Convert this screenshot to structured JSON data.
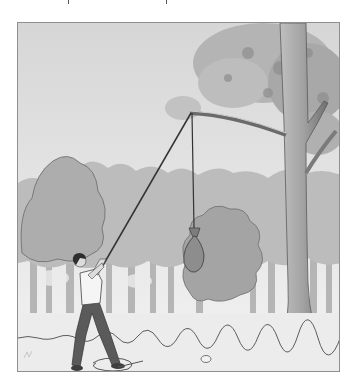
{
  "scene": {
    "description": "Person pulling a rope looped over a tree branch to hoist a hanging bag in a forest",
    "elements": [
      "sky",
      "background-trees",
      "foreground-bush",
      "large-tree",
      "branch",
      "rope",
      "hanging-bag",
      "person",
      "coiled-rope",
      "stone",
      "ground"
    ]
  },
  "colors": {
    "background": "#ffffff",
    "frame_border": "#8f8f8f",
    "sky_top": "#d9d9d9",
    "sky_bottom": "#f2f2f2",
    "tree_canopy": "#b8b8b8",
    "tree_canopy_dark": "#9a9a9a",
    "bush": "#a9a9a9",
    "trunk_light": "#bdbdbd",
    "trunk_dark": "#7a7a7a",
    "ground": "#ececec",
    "rope": "#3a3a3a",
    "bag": "#8a8a8a",
    "shirt": "#f4f4f4",
    "pants": "#5e5e5e",
    "hair": "#2e2e2e",
    "skin": "#dcdcdc"
  }
}
